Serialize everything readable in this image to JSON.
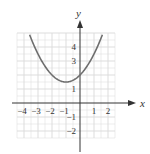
{
  "chart_data": {
    "type": "line",
    "title": "",
    "xlabel": "x",
    "ylabel": "y",
    "xlim": [
      -4.6,
      2.6
    ],
    "ylim": [
      -2.6,
      5.0
    ],
    "grid": true,
    "x_ticks": [
      -4,
      -3,
      -2,
      -1,
      1,
      2
    ],
    "y_ticks": [
      4,
      3,
      1,
      -1,
      -2
    ],
    "series": [
      {
        "name": "parabola",
        "equation": "y = 0.5(x+1)^2 + 1.5",
        "vertex": [
          -1,
          1.5
        ],
        "x": [
          -3.6,
          -3,
          -2.5,
          -2,
          -1.5,
          -1,
          -0.5,
          0,
          0.5,
          1,
          1.6
        ],
        "values": [
          4.88,
          3.5,
          2.63,
          2.0,
          1.63,
          1.5,
          1.63,
          2.0,
          2.63,
          3.5,
          4.88
        ],
        "color": "#6e6e6e"
      }
    ]
  },
  "colors": {
    "grid": "#d9d9d9",
    "axis": "#333333",
    "curve": "#6e6e6e"
  }
}
